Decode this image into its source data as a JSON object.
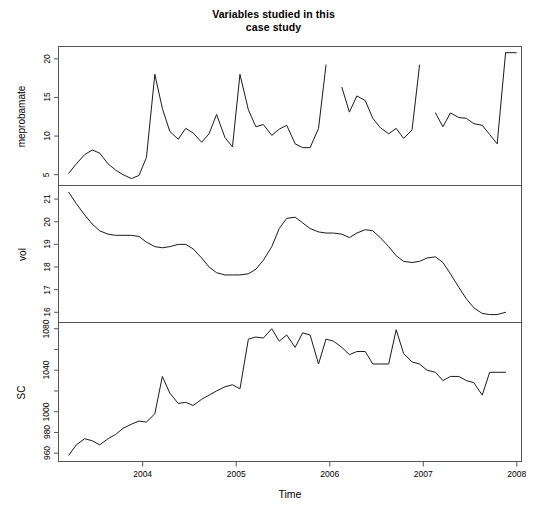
{
  "figure": {
    "title_line1": "Variables studied in this",
    "title_line2": "case study",
    "xlabel": "Time",
    "line_color": "#1a1a1a",
    "frame_color": "#555555",
    "background": "#ffffff"
  },
  "axes": {
    "x": {
      "label": "Time",
      "ticks": [
        2004,
        2005,
        2006,
        2007,
        2008
      ],
      "tick_labels": [
        "2004",
        "2005",
        "2006",
        "2007",
        "2008"
      ],
      "range": [
        2003.1,
        2008.05
      ]
    }
  },
  "chart_data": [
    {
      "type": "line",
      "panel": 1,
      "title": "Variables studied in this case study",
      "name": "meprobamate",
      "ylabel": "meprobamate",
      "xlabel": "",
      "ytick_labels": [
        "5",
        "10",
        "15",
        "20"
      ],
      "yticks": [
        5,
        10,
        15,
        20
      ],
      "ylim": [
        3.6,
        21.6
      ],
      "xlim": [
        2003.1,
        2008.05
      ],
      "grid": false,
      "legend": "none",
      "x": [
        2003.21,
        2003.29,
        2003.38,
        2003.46,
        2003.54,
        2003.63,
        2003.71,
        2003.79,
        2003.88,
        2003.96,
        2004.04,
        2004.13,
        2004.21,
        2004.29,
        2004.38,
        2004.46,
        2004.54,
        2004.63,
        2004.71,
        2004.79,
        2004.88,
        2004.96,
        2005.04,
        2005.13,
        2005.21,
        2005.29,
        2005.38,
        2005.46,
        2005.54,
        2005.63,
        2005.71,
        2005.79,
        2005.88,
        2005.96,
        2006.13,
        2006.21,
        2006.29,
        2006.38,
        2006.46,
        2006.54,
        2006.63,
        2006.71,
        2006.79,
        2006.88,
        2006.96,
        2007.13,
        2007.21,
        2007.29,
        2007.38,
        2007.46,
        2007.54,
        2007.63,
        2007.71,
        2007.79,
        2007.88
      ],
      "values": [
        5.2,
        6.4,
        7.6,
        8.2,
        7.8,
        6.4,
        5.6,
        5.0,
        4.5,
        4.9,
        7.2,
        18.0,
        13.6,
        10.6,
        9.6,
        11.0,
        10.4,
        9.2,
        10.3,
        12.8,
        9.8,
        8.6,
        18.0,
        13.4,
        11.2,
        11.5,
        10.1,
        10.9,
        11.4,
        9.0,
        8.5,
        8.5,
        11.0,
        19.2,
        16.3,
        13.1,
        15.2,
        14.6,
        12.3,
        11.1,
        10.3,
        11.0,
        9.7,
        10.8,
        19.2,
        13.0,
        11.2,
        13.0,
        12.4,
        12.3,
        11.6,
        11.4,
        10.2,
        9.0,
        20.8
      ],
      "gaps": [
        {
          "after_x": 2005.96,
          "before_x": 2006.13
        },
        {
          "after_x": 2006.96,
          "before_x": 2007.13
        }
      ],
      "notes": "Series has missing values (gaps) in early 2006 and early 2007; final point near 21 drawn as a short flat segment."
    },
    {
      "type": "line",
      "panel": 2,
      "name": "vol",
      "ylabel": "vol",
      "xlabel": "",
      "ytick_labels": [
        "16",
        "17",
        "18",
        "19",
        "20",
        "21"
      ],
      "yticks": [
        16,
        17,
        18,
        19,
        20,
        21
      ],
      "ylim": [
        15.55,
        21.6
      ],
      "xlim": [
        2003.1,
        2008.05
      ],
      "grid": false,
      "legend": "none",
      "x": [
        2003.21,
        2003.29,
        2003.38,
        2003.46,
        2003.54,
        2003.63,
        2003.71,
        2003.79,
        2003.88,
        2003.96,
        2004.04,
        2004.13,
        2004.21,
        2004.29,
        2004.38,
        2004.46,
        2004.54,
        2004.63,
        2004.71,
        2004.79,
        2004.88,
        2004.96,
        2005.04,
        2005.13,
        2005.21,
        2005.29,
        2005.38,
        2005.46,
        2005.54,
        2005.63,
        2005.71,
        2005.79,
        2005.88,
        2005.96,
        2006.04,
        2006.13,
        2006.21,
        2006.29,
        2006.38,
        2006.46,
        2006.54,
        2006.63,
        2006.71,
        2006.79,
        2006.88,
        2006.96,
        2007.04,
        2007.13,
        2007.21,
        2007.29,
        2007.38,
        2007.46,
        2007.54,
        2007.63,
        2007.71,
        2007.79,
        2007.88
      ],
      "values": [
        21.3,
        20.8,
        20.3,
        19.9,
        19.6,
        19.45,
        19.4,
        19.4,
        19.4,
        19.35,
        19.1,
        18.9,
        18.85,
        18.9,
        19.0,
        19.0,
        18.8,
        18.4,
        18.0,
        17.75,
        17.65,
        17.65,
        17.65,
        17.7,
        17.9,
        18.3,
        18.9,
        19.7,
        20.15,
        20.2,
        19.95,
        19.7,
        19.55,
        19.5,
        19.5,
        19.45,
        19.3,
        19.5,
        19.65,
        19.6,
        19.3,
        18.9,
        18.5,
        18.25,
        18.2,
        18.25,
        18.4,
        18.45,
        18.2,
        17.7,
        17.1,
        16.6,
        16.2,
        15.95,
        15.9,
        15.9,
        16.0
      ],
      "notes": "Smooth continuous series, no gaps."
    },
    {
      "type": "line",
      "panel": 3,
      "name": "SC",
      "ylabel": "SC",
      "xlabel": "Time",
      "ytick_labels": [
        "960",
        "980",
        "1000",
        "1040",
        "1080"
      ],
      "yticks": [
        960,
        980,
        1000,
        1040,
        1080
      ],
      "minor_yticks": [
        1020,
        1060
      ],
      "ylim": [
        952,
        1086
      ],
      "xlim": [
        2003.1,
        2008.05
      ],
      "grid": false,
      "legend": "none",
      "x": [
        2003.21,
        2003.29,
        2003.38,
        2003.46,
        2003.54,
        2003.63,
        2003.71,
        2003.79,
        2003.88,
        2003.96,
        2004.04,
        2004.13,
        2004.21,
        2004.29,
        2004.38,
        2004.46,
        2004.54,
        2004.63,
        2004.71,
        2004.79,
        2004.88,
        2004.96,
        2005.04,
        2005.13,
        2005.21,
        2005.29,
        2005.38,
        2005.46,
        2005.54,
        2005.63,
        2005.71,
        2005.79,
        2005.88,
        2005.96,
        2006.04,
        2006.13,
        2006.21,
        2006.29,
        2006.38,
        2006.46,
        2006.54,
        2006.63,
        2006.71,
        2006.79,
        2006.88,
        2006.96,
        2007.04,
        2007.13,
        2007.21,
        2007.29,
        2007.38,
        2007.46,
        2007.54,
        2007.63,
        2007.71,
        2007.79,
        2007.88
      ],
      "values": [
        958,
        968,
        974,
        972,
        968,
        974,
        978,
        984,
        988,
        991,
        990,
        998,
        1034,
        1018,
        1008,
        1009,
        1006,
        1012,
        1016,
        1020,
        1024,
        1026,
        1022,
        1070,
        1072,
        1071,
        1080,
        1068,
        1074,
        1062,
        1076,
        1074,
        1046,
        1070,
        1068,
        1062,
        1055,
        1058,
        1058,
        1046,
        1046,
        1046,
        1079,
        1056,
        1048,
        1046,
        1040,
        1038,
        1030,
        1034,
        1034,
        1030,
        1028,
        1016,
        1038,
        1038,
        1038
      ],
      "notes": "Step-like increases around 2004 and 2005; gradual decline after 2006."
    }
  ]
}
